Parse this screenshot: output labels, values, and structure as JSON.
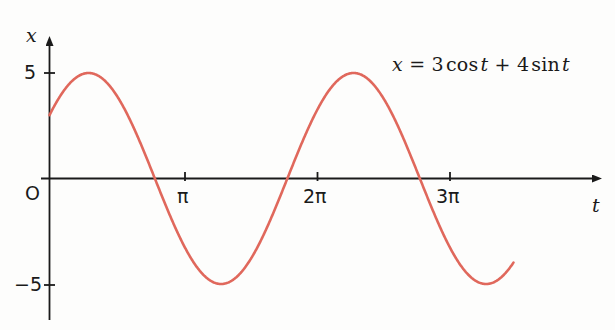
{
  "figure": {
    "background_color": "#fdfdfc",
    "axis_color": "#1a1a1a",
    "curve_color": "#e0685c"
  },
  "annotations": {
    "equation_x": "x",
    "equation_eq": "=",
    "equation_term1_coef": "3",
    "equation_term1_fn": "cos",
    "equation_term1_var": "t",
    "equation_plus": "+",
    "equation_term2_coef": "4",
    "equation_term2_fn": "sin",
    "equation_term2_var": "t",
    "equation_full": "x = 3 cos t + 4 sin t"
  },
  "axes": {
    "y_axis_label": "x",
    "x_axis_label": "t",
    "origin_label": "O",
    "y_tick_labels": [
      "5",
      "−5"
    ],
    "x_tick_labels": [
      "π",
      "2π",
      "3π"
    ]
  },
  "chart_data": {
    "type": "line",
    "title": "",
    "subtitle": "",
    "xlabel": "t",
    "ylabel": "x",
    "equation": "x = 3 cos t + 4 sin t",
    "amplitude": 5,
    "phase_shift_rad": 0.9273,
    "period": "2π",
    "grid": false,
    "legend_position": "none",
    "xlim": [
      -0.35,
      11.1
    ],
    "ylim": [
      -6.3,
      6.3
    ],
    "xtick_values": [
      3.14159,
      6.28319,
      9.42478
    ],
    "xtick_labels": [
      "π",
      "2π",
      "3π"
    ],
    "ytick_values": [
      5,
      -5
    ],
    "ytick_labels": [
      "5",
      "−5"
    ],
    "annotations": [
      {
        "text": "x = 3 cos t + 4 sin t",
        "x": 7.6,
        "y": 5.0
      }
    ],
    "series": [
      {
        "name": "x = 3 cos t + 4 sin t",
        "color": "#e0685c",
        "x": [
          0,
          0.3,
          0.6,
          0.9273,
          1.2,
          1.5,
          1.8,
          2.1,
          2.4,
          2.7,
          3.0,
          3.14159,
          3.5,
          3.8,
          4.0689,
          4.4,
          4.7,
          5.0,
          5.3,
          5.6,
          5.9,
          6.28319,
          6.6,
          6.9,
          7.2105,
          7.5,
          7.8,
          8.1,
          8.4,
          8.7,
          9.0,
          9.42478,
          9.8,
          10.1,
          10.2105,
          10.5,
          10.8,
          11.0
        ],
        "y": [
          3.0,
          4.05,
          4.73,
          5.0,
          4.82,
          4.34,
          3.58,
          2.58,
          1.42,
          0.17,
          -1.08,
          -1.64,
          -3.47,
          -4.35,
          -4.95,
          -4.82,
          -4.3,
          -3.46,
          -2.36,
          -1.09,
          0.26,
          2.0,
          3.23,
          4.22,
          4.95,
          4.9,
          4.52,
          3.83,
          2.87,
          1.7,
          0.4,
          -1.36,
          -3.05,
          -4.07,
          -4.32,
          -4.89,
          -4.97,
          -4.73
        ]
      }
    ]
  }
}
